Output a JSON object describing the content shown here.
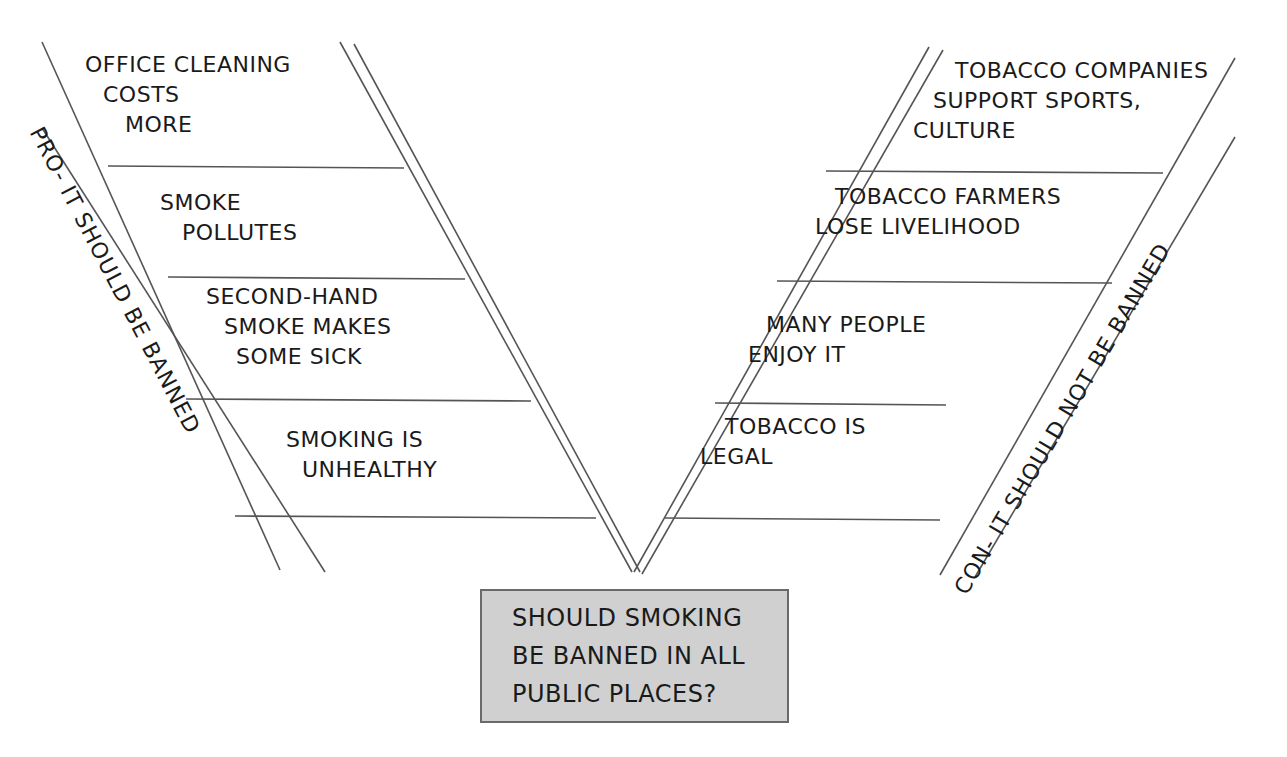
{
  "diagram": {
    "type": "argument-v-diagram",
    "question": {
      "lines": [
        "SHOULD SMOKING",
        "BE BANNED IN ALL",
        "PUBLIC PLACES?"
      ],
      "fill": "#d0d0d0"
    },
    "pro": {
      "banner": "PRO- IT SHOULD BE BANNED",
      "reasons": [
        {
          "lines": [
            "OFFICE CLEANING",
            "COSTS",
            "MORE"
          ]
        },
        {
          "lines": [
            "SMOKE",
            "POLLUTES"
          ]
        },
        {
          "lines": [
            "SECOND-HAND",
            "SMOKE MAKES",
            "SOME SICK"
          ]
        },
        {
          "lines": [
            "SMOKING IS",
            "UNHEALTHY"
          ]
        }
      ]
    },
    "con": {
      "banner": "CON- IT SHOULD NOT BE BANNED",
      "reasons": [
        {
          "lines": [
            "TOBACCO COMPANIES",
            "SUPPORT SPORTS,",
            "CULTURE"
          ]
        },
        {
          "lines": [
            "TOBACCO FARMERS",
            "LOSE LIVELIHOOD"
          ]
        },
        {
          "lines": [
            "MANY PEOPLE",
            "ENJOY IT"
          ]
        },
        {
          "lines": [
            "TOBACCO IS",
            "LEGAL"
          ]
        }
      ]
    },
    "line_color": "#555555"
  }
}
